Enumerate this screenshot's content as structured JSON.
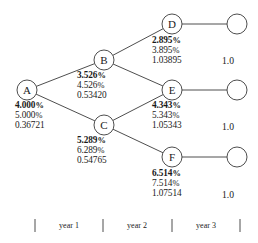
{
  "diagram": {
    "nodes": [
      {
        "id": "A",
        "label": "A",
        "cx": 27,
        "cy": 90
      },
      {
        "id": "B",
        "label": "B",
        "cx": 104,
        "cy": 60
      },
      {
        "id": "C",
        "label": "C",
        "cx": 104,
        "cy": 125
      },
      {
        "id": "D",
        "label": "D",
        "cx": 172,
        "cy": 24
      },
      {
        "id": "E",
        "label": "E",
        "cx": 172,
        "cy": 90
      },
      {
        "id": "F",
        "label": "F",
        "cx": 172,
        "cy": 157
      }
    ],
    "terminal_nodes": [
      {
        "id": "T1",
        "cx": 237,
        "cy": 24
      },
      {
        "id": "T2",
        "cx": 237,
        "cy": 90
      },
      {
        "id": "T3",
        "cx": 237,
        "cy": 157
      }
    ],
    "edges": [
      {
        "from": "A",
        "to": "B"
      },
      {
        "from": "A",
        "to": "C"
      },
      {
        "from": "B",
        "to": "D"
      },
      {
        "from": "B",
        "to": "E"
      },
      {
        "from": "C",
        "to": "E"
      },
      {
        "from": "C",
        "to": "F"
      },
      {
        "from": "D",
        "to": "T1"
      },
      {
        "from": "E",
        "to": "T2"
      },
      {
        "from": "F",
        "to": "T3"
      }
    ],
    "node_info": [
      {
        "node": "A",
        "rate": "4.000",
        "rate_alt": "5.000",
        "value": "0.36721",
        "pct": "%",
        "x": 15,
        "y": 101
      },
      {
        "node": "B",
        "rate": "3.526",
        "rate_alt": "4.526",
        "value": "0.53420",
        "pct": "%",
        "x": 77,
        "y": 71
      },
      {
        "node": "C",
        "rate": "5.289",
        "rate_alt": "6.289",
        "value": "0.54765",
        "pct": "%",
        "x": 77,
        "y": 136
      },
      {
        "node": "D",
        "rate": "2.895",
        "rate_alt": "3.895",
        "value": "1.03895",
        "pct": "%",
        "x": 152,
        "y": 36
      },
      {
        "node": "E",
        "rate": "4.343",
        "rate_alt": "5.343",
        "value": "1.05343",
        "pct": "%",
        "x": 152,
        "y": 101
      },
      {
        "node": "F",
        "rate": "6.514",
        "rate_alt": "7.514",
        "value": "1.07514",
        "pct": "%",
        "x": 152,
        "y": 169
      }
    ],
    "terminal_values": [
      {
        "text": "1.0",
        "x": 222,
        "y": 55
      },
      {
        "text": "1.0",
        "x": 222,
        "y": 121
      },
      {
        "text": "1.0",
        "x": 222,
        "y": 189
      }
    ],
    "timeline": {
      "ticks": [
        {
          "x": 35,
          "y1": 219,
          "y2": 232
        },
        {
          "x": 103,
          "y1": 219,
          "y2": 232
        },
        {
          "x": 172,
          "y1": 219,
          "y2": 232
        },
        {
          "x": 240,
          "y1": 219,
          "y2": 232
        }
      ],
      "periods": [
        {
          "label": "year 1",
          "cx": 69,
          "y": 221
        },
        {
          "label": "year 2",
          "cx": 137,
          "y": 221
        },
        {
          "label": "year 3",
          "cx": 206,
          "y": 221
        }
      ]
    },
    "colors": {
      "stroke": "#3a3a3a",
      "text": "#1a1a1a",
      "background": "#ffffff"
    }
  }
}
